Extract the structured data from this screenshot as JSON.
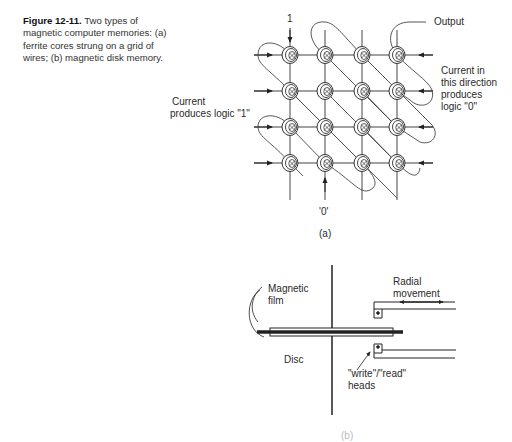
{
  "caption": {
    "figure_number": "Figure 12-11.",
    "text": "Two types of magnetic computer memories: (a) ferrite cores strung on a grid of wires; (b) magnetic disk memory."
  },
  "diagram_a": {
    "label_top_wire": "1",
    "label_bottom_wire": "'0'",
    "label_output": "Output",
    "label_current_left_1": "Current",
    "label_current_left_2": "produces logic \"1\"",
    "label_current_right_1": "Current in",
    "label_current_right_2": "this direction",
    "label_current_right_3": "produces",
    "label_current_right_4": "logic \"0\"",
    "sublabel": "(a)",
    "grid": {
      "rows": 4,
      "cols": 4
    }
  },
  "diagram_b": {
    "label_film_1": "Magnetic",
    "label_film_2": "film",
    "label_disc": "Disc",
    "label_heads_1": "\"write\"/\"read\"",
    "label_heads_2": "heads",
    "label_radial_1": "Radial",
    "label_radial_2": "movement",
    "sublabel": "(b)"
  }
}
